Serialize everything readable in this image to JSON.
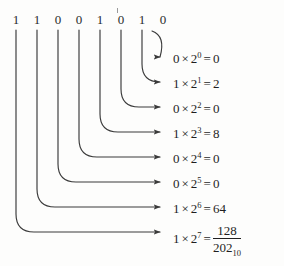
{
  "figure": {
    "binary_digits": [
      "1",
      "1",
      "0",
      "0",
      "1",
      "0",
      "1",
      "0"
    ],
    "binary_value": "11001010",
    "rows": [
      {
        "bit": "0",
        "times": "×",
        "base": "2",
        "exponent": "0",
        "equals": "=",
        "result": "0"
      },
      {
        "bit": "1",
        "times": "×",
        "base": "2",
        "exponent": "1",
        "equals": "=",
        "result": "2"
      },
      {
        "bit": "0",
        "times": "×",
        "base": "2",
        "exponent": "2",
        "equals": "=",
        "result": "0"
      },
      {
        "bit": "1",
        "times": "×",
        "base": "2",
        "exponent": "3",
        "equals": "=",
        "result": "8"
      },
      {
        "bit": "0",
        "times": "×",
        "base": "2",
        "exponent": "4",
        "equals": "=",
        "result": "0"
      },
      {
        "bit": "0",
        "times": "×",
        "base": "2",
        "exponent": "5",
        "equals": "=",
        "result": "0"
      },
      {
        "bit": "1",
        "times": "×",
        "base": "2",
        "exponent": "6",
        "equals": "=",
        "result": "64"
      },
      {
        "bit": "1",
        "times": "×",
        "base": "2",
        "exponent": "7",
        "equals": "=",
        "result": "128"
      }
    ],
    "total": {
      "value": "202",
      "subscript": "10"
    },
    "colors": {
      "background": "#fdfdfc",
      "text": "#1f1f1f",
      "stroke": "#3a3a3a"
    }
  }
}
